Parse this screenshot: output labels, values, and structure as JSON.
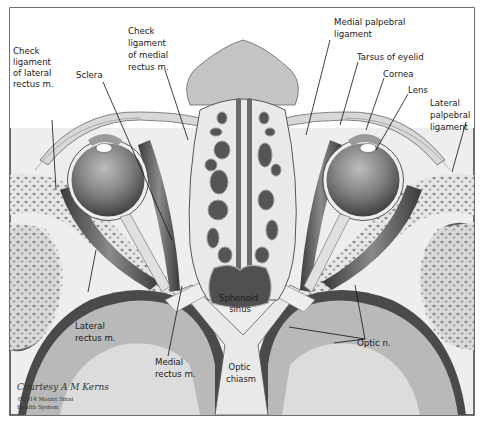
{
  "figure": {
    "labels": {
      "check_ligament_lateral": [
        "Check",
        "ligament",
        "of lateral",
        "rectus m."
      ],
      "sclera": "Sclera",
      "check_ligament_medial": [
        "Check",
        "ligament",
        "of medial",
        "rectus m."
      ],
      "medial_palpebral": [
        "Medial palpebral",
        "ligament"
      ],
      "tarsus": "Tarsus of eyelid",
      "cornea": "Cornea",
      "lens": "Lens",
      "lateral_palpebral": [
        "Lateral",
        "palpebral",
        "ligament"
      ],
      "lateral_rectus": [
        "Lateral",
        "rectus m."
      ],
      "medial_rectus": [
        "Medial",
        "rectus m."
      ],
      "sphenoid_sinus": [
        "Sphenoid",
        "sinus"
      ],
      "optic_chiasm": [
        "Optic",
        "chiasm"
      ],
      "optic_nerve": "Optic n."
    },
    "credit": {
      "signature": "Courtesy A M Kerns",
      "copyright_line1": "©2014 Mount Sinai",
      "copyright_line2": "Health System"
    },
    "colors": {
      "frame": "#333333",
      "background_tissue": "#e8e8e8",
      "brain_light": "#dcdcdc",
      "brain_mid": "#b9b9b9",
      "dark_band": "#4a4a4a",
      "bone": "#d2d2d2",
      "eyeball": "#7a7a7a"
    }
  }
}
